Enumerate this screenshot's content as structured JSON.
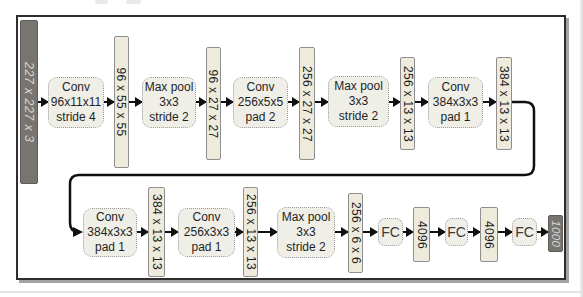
{
  "colors": {
    "frame_border": "#2e2e2e",
    "frame_shadow": "#a3a3a3",
    "dark_bar_fill": "#787571",
    "dark_bar_border": "#5f5d5a",
    "dark_bar_text": "#d8d6d2",
    "light_bar_fill": "#eeebdd",
    "light_bar_border": "#8f8f8f",
    "op_box_fill": "#efefe8",
    "op_box_border": "#9c9c9c",
    "text": "#1f1f1f",
    "arrow": "#101010"
  },
  "figure": {
    "top_row": [
      {
        "type": "io_bar",
        "label": "227 x 227 x 3"
      },
      {
        "type": "op_box",
        "lines": [
          "Conv",
          "96x11x11",
          "stride 4"
        ]
      },
      {
        "type": "feature_bar",
        "label": "96 x 55 x 55"
      },
      {
        "type": "op_box",
        "lines": [
          "Max pool",
          "3x3",
          "stride 2"
        ]
      },
      {
        "type": "feature_bar",
        "label": "96 x 27 x 27"
      },
      {
        "type": "op_box",
        "lines": [
          "Conv",
          "256x5x5",
          "pad 2"
        ]
      },
      {
        "type": "feature_bar",
        "label": "256 x 27 x 27"
      },
      {
        "type": "op_box",
        "lines": [
          "Max pool",
          "3x3",
          "stride 2"
        ]
      },
      {
        "type": "feature_bar",
        "label": "256 x 13 x 13"
      },
      {
        "type": "op_box",
        "lines": [
          "Conv",
          "384x3x3",
          "pad 1"
        ]
      },
      {
        "type": "feature_bar",
        "label": "384 x 13 x 13"
      }
    ],
    "bottom_row": [
      {
        "type": "op_box",
        "lines": [
          "Conv",
          "384x3x3",
          "pad 1"
        ]
      },
      {
        "type": "feature_bar",
        "label": "384 x 13 x 13"
      },
      {
        "type": "op_box",
        "lines": [
          "Conv",
          "256x3x3",
          "pad 1"
        ]
      },
      {
        "type": "feature_bar",
        "label": "256 x 13 x 13"
      },
      {
        "type": "op_box",
        "lines": [
          "Max pool",
          "3x3",
          "stride 2"
        ]
      },
      {
        "type": "feature_bar",
        "label": "256 x 6 x 6"
      },
      {
        "type": "fc_box",
        "label": "FC"
      },
      {
        "type": "feature_bar",
        "label": "4096"
      },
      {
        "type": "fc_box",
        "label": "FC"
      },
      {
        "type": "feature_bar",
        "label": "4096"
      },
      {
        "type": "fc_box",
        "label": "FC"
      },
      {
        "type": "io_bar",
        "label": "1000"
      }
    ]
  }
}
